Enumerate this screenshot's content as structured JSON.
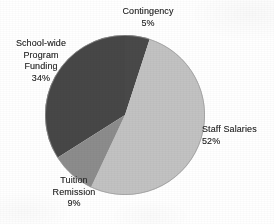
{
  "chart_data": {
    "type": "pie",
    "title": "",
    "subtitle": "",
    "xlabel": "",
    "ylabel": "",
    "legend_position": "none",
    "labels_position": "outside-callout-free",
    "grid": false,
    "units": "percent",
    "total": 100,
    "categories": [
      "Contingency",
      "Staff Salaries",
      "Tuition Remission",
      "School-wide Program Funding"
    ],
    "values": [
      5,
      52,
      9,
      34
    ],
    "start_angle_deg": 0,
    "direction": "clockwise",
    "slices": [
      {
        "label": "Contingency",
        "label_lines": [
          "Contingency"
        ],
        "value": 5,
        "value_text": "5%",
        "color": "#4a4a4a",
        "start_deg": 0,
        "end_deg": 18
      },
      {
        "label": "Staff Salaries",
        "label_lines": [
          "Staff Salaries"
        ],
        "value": 52,
        "value_text": "52%",
        "color": "#c2c2c2",
        "start_deg": 18,
        "end_deg": 205.2
      },
      {
        "label": "Tuition Remission",
        "label_lines": [
          "Tuition",
          "Remission"
        ],
        "value": 9,
        "value_text": "9%",
        "color": "#8c8c8c",
        "start_deg": 205.2,
        "end_deg": 237.6
      },
      {
        "label": "School-wide Program Funding",
        "label_lines": [
          "School-wide",
          "Program",
          "Funding"
        ],
        "value": 34,
        "value_text": "34%",
        "color": "#464646",
        "start_deg": 237.6,
        "end_deg": 360
      }
    ]
  },
  "labels": {
    "contingency": {
      "line1": "Contingency",
      "pct": "5%"
    },
    "staff_salaries": {
      "line1": "Staff Salaries",
      "pct": "52%"
    },
    "tuition_remission": {
      "line1": "Tuition",
      "line2": "Remission",
      "pct": "9%"
    },
    "school_wide": {
      "line1": "School-wide",
      "line2": "Program",
      "line3": "Funding",
      "pct": "34%"
    }
  },
  "colors": {
    "background": "#ffffff",
    "text": "#2b2b2b",
    "slice_contingency": "#4a4a4a",
    "slice_staff_salaries": "#c2c2c2",
    "slice_tuition_remission": "#8c8c8c",
    "slice_school_wide": "#464646",
    "slice_outline": "#9a9a9a"
  }
}
